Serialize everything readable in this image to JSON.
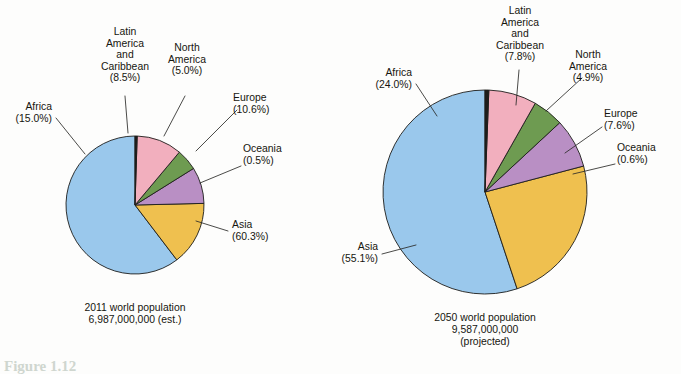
{
  "figure": {
    "caption_partial": "Figure 1.12",
    "background_color": "#fdfdfc"
  },
  "palette": {
    "asia": "#9ac8ec",
    "africa": "#efc04f",
    "latin_america": "#b98fc4",
    "north_america": "#6e9b51",
    "europe": "#f2afbe",
    "oceania": "#1d1d1b",
    "outline": "#1d1d1b",
    "text": "#16160f"
  },
  "chart_data": [
    {
      "type": "pie",
      "id": "pie-2011",
      "title": "2011 world population",
      "caption_lines": [
        "2011 world population",
        "6,987,000,000 (est.)"
      ],
      "total_population": "6,987,000,000",
      "year": "2011",
      "estimate_note": "(est.)",
      "categories": [
        "Asia",
        "Africa",
        "Latin America and Caribbean",
        "North America",
        "Europe",
        "Oceania"
      ],
      "values": [
        60.3,
        15.0,
        8.5,
        5.0,
        10.6,
        0.5
      ],
      "unit": "percent",
      "legend": "labels-with-leader-lines",
      "slices": [
        {
          "name": "Asia",
          "value": 60.3,
          "label_lines": [
            "Asia",
            "(60.3%)"
          ],
          "color_key": "asia",
          "label_x": 232,
          "label_y": 228,
          "label_anchor": "start",
          "leader": [
            [
              228,
              231
            ],
            [
              196,
              221
            ]
          ]
        },
        {
          "name": "Africa",
          "value": 15.0,
          "label_lines": [
            "Africa",
            "(15.0%)"
          ],
          "color_key": "africa",
          "label_x": 52,
          "label_y": 110,
          "label_anchor": "end",
          "leader": [
            [
              56,
              118
            ],
            [
              85,
              154
            ]
          ]
        },
        {
          "name": "Latin America and Caribbean",
          "value": 8.5,
          "label_lines": [
            "Latin",
            "America",
            "and",
            "Caribbean",
            "(8.5%)"
          ],
          "color_key": "latin_america",
          "label_x": 125,
          "label_y": 35,
          "label_anchor": "middle",
          "leader": [
            [
              125,
              96
            ],
            [
              128,
              133
            ]
          ]
        },
        {
          "name": "North America",
          "value": 5.0,
          "label_lines": [
            "North",
            "America",
            "(5.0%)"
          ],
          "color_key": "north_america",
          "label_x": 187,
          "label_y": 51,
          "label_anchor": "middle",
          "leader": [
            [
              185,
              96
            ],
            [
              164,
              136
            ]
          ]
        },
        {
          "name": "Europe",
          "value": 10.6,
          "label_lines": [
            "Europe",
            "(10.6%)"
          ],
          "color_key": "europe",
          "label_x": 233,
          "label_y": 101,
          "label_anchor": "start",
          "leader": [
            [
              237,
              110
            ],
            [
              196,
              151
            ]
          ]
        },
        {
          "name": "Oceania",
          "value": 0.5,
          "label_lines": [
            "Oceania",
            "(0.5%)"
          ],
          "color_key": "oceania",
          "label_x": 243,
          "label_y": 152,
          "label_anchor": "start",
          "leader": [
            [
              241,
              166
            ],
            [
              200,
              183
            ]
          ]
        }
      ],
      "geometry": {
        "cx": 135,
        "cy": 205,
        "r": 69,
        "start_angle_deg": -90,
        "direction": "counterclockwise"
      },
      "caption_x": 135,
      "caption_y": 311
    },
    {
      "type": "pie",
      "id": "pie-2050",
      "title": "2050 world population",
      "caption_lines": [
        "2050 world population",
        "9,587,000,000",
        "(projected)"
      ],
      "total_population": "9,587,000,000",
      "year": "2050",
      "estimate_note": "(projected)",
      "categories": [
        "Asia",
        "Africa",
        "Latin America and Caribbean",
        "North America",
        "Europe",
        "Oceania"
      ],
      "values": [
        55.1,
        24.0,
        7.8,
        4.9,
        7.6,
        0.6
      ],
      "unit": "percent",
      "legend": "labels-with-leader-lines",
      "slices": [
        {
          "name": "Asia",
          "value": 55.1,
          "label_lines": [
            "Asia",
            "(55.1%)"
          ],
          "color_key": "asia",
          "label_x": 378,
          "label_y": 250,
          "label_anchor": "end",
          "leader": [
            [
              382,
              254
            ],
            [
              416,
              245
            ]
          ]
        },
        {
          "name": "Africa",
          "value": 24.0,
          "label_lines": [
            "Africa",
            "(24.0%)"
          ],
          "color_key": "africa",
          "label_x": 412,
          "label_y": 76,
          "label_anchor": "end",
          "leader": [
            [
              416,
              84
            ],
            [
              437,
              116
            ]
          ]
        },
        {
          "name": "Latin America and Caribbean",
          "value": 7.8,
          "label_lines": [
            "Latin",
            "America",
            "and",
            "Caribbean",
            "(7.8%)"
          ],
          "color_key": "latin_america",
          "label_x": 520,
          "label_y": 14,
          "label_anchor": "middle",
          "leader": [
            [
              519,
              70
            ],
            [
              516,
              105
            ]
          ]
        },
        {
          "name": "North America",
          "value": 4.9,
          "label_lines": [
            "North",
            "America",
            "(4.9%)"
          ],
          "color_key": "north_america",
          "label_x": 588,
          "label_y": 58,
          "label_anchor": "middle",
          "leader": [
            [
              582,
              78
            ],
            [
              546,
              111
            ]
          ]
        },
        {
          "name": "Europe",
          "value": 7.6,
          "label_lines": [
            "Europe",
            "(7.6%)"
          ],
          "color_key": "europe",
          "label_x": 604,
          "label_y": 117,
          "label_anchor": "start",
          "leader": [
            [
              602,
              127
            ],
            [
              565,
              153
            ]
          ]
        },
        {
          "name": "Oceania",
          "value": 0.6,
          "label_lines": [
            "Oceania",
            "(0.6%)"
          ],
          "color_key": "oceania",
          "label_x": 617,
          "label_y": 151,
          "label_anchor": "start",
          "leader": [
            [
              615,
              164
            ],
            [
              573,
              174
            ]
          ]
        }
      ],
      "geometry": {
        "cx": 485,
        "cy": 192,
        "r": 102,
        "start_angle_deg": -90,
        "direction": "counterclockwise"
      },
      "caption_x": 485,
      "caption_y": 321
    }
  ]
}
